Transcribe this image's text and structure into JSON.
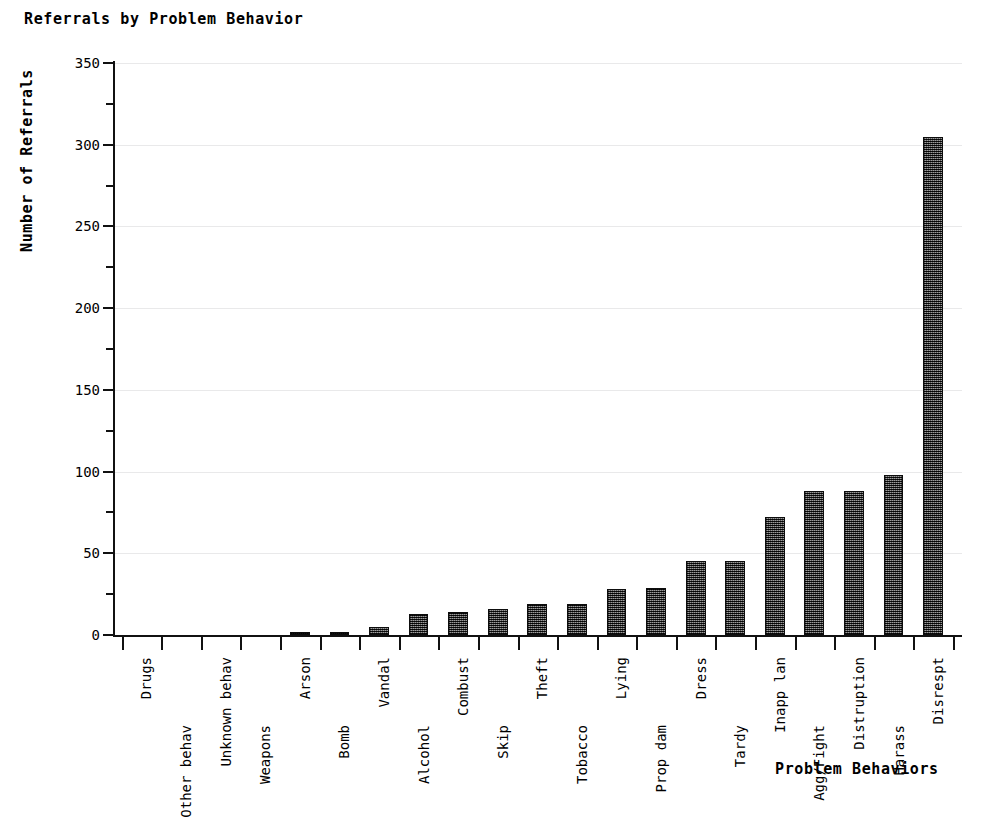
{
  "chart_data": {
    "type": "bar",
    "title": "Referrals by Problem Behavior",
    "xlabel": "Problem Behaviors",
    "ylabel": "Number of Referrals",
    "ylim": [
      0,
      350
    ],
    "ytick_step": 50,
    "yminor_step": 25,
    "grid": true,
    "grid_axis": "y",
    "legend": "none",
    "bar_color": "#4a4a4a",
    "bar_edge_color": "#0d0d0d",
    "categories": [
      "Drugs",
      "Other behav",
      "Unknown behav",
      "Weapons",
      "Arson",
      "Bomb",
      "Vandal",
      "Alcohol",
      "Combust",
      "Skip",
      "Theft",
      "Tobacco",
      "Lying",
      "Prop dam",
      "Dress",
      "Tardy",
      "Inapp lan",
      "Agg/Fight",
      "Distruption",
      "Harass",
      "Disrespt"
    ],
    "values": [
      0,
      0,
      0,
      0,
      1,
      1,
      5,
      13,
      14,
      16,
      19,
      19,
      28,
      29,
      45,
      45,
      72,
      88,
      88,
      98,
      305
    ],
    "ytick_labels": [
      "0",
      "50",
      "100",
      "150",
      "200",
      "250",
      "300",
      "350"
    ],
    "ytick_values": [
      0,
      50,
      100,
      150,
      200,
      250,
      300,
      350
    ]
  },
  "caption": {
    "text": "",
    "visible": false
  }
}
